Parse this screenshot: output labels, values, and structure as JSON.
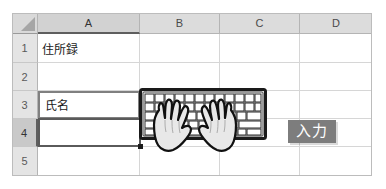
{
  "app": {
    "type": "spreadsheet",
    "accent_header_bg": "#dcdcdc",
    "selection_border": "#5a5a5a",
    "badge_bg": "#7d7d7d"
  },
  "grid": {
    "select_all_label": "",
    "columns": [
      {
        "label": "A",
        "active": true,
        "x": 26,
        "width": 102
      },
      {
        "label": "B",
        "active": false,
        "x": 128,
        "width": 80
      },
      {
        "label": "C",
        "active": false,
        "x": 208,
        "width": 80
      },
      {
        "label": "D",
        "active": false,
        "x": 288,
        "width": 72
      }
    ],
    "rows": [
      {
        "label": "1",
        "active": false,
        "y": 21,
        "height": 29
      },
      {
        "label": "2",
        "active": false,
        "y": 50,
        "height": 28
      },
      {
        "label": "3",
        "active": false,
        "y": 78,
        "height": 28
      },
      {
        "label": "4",
        "active": true,
        "y": 106,
        "height": 28
      },
      {
        "label": "5",
        "active": false,
        "y": 134,
        "height": 28
      }
    ],
    "cells": [
      {
        "ref": "A1",
        "value": "住所録"
      },
      {
        "ref": "A2",
        "value": ""
      },
      {
        "ref": "A3",
        "value": "氏名"
      },
      {
        "ref": "A4",
        "value": ""
      },
      {
        "ref": "A5",
        "value": ""
      }
    ]
  },
  "selection": {
    "boxed_cell_ref": "A3",
    "active_cell_ref": "A4",
    "fill_handle_visible": true
  },
  "illustration": {
    "keyboard_name": "keyboard-illustration",
    "hands_name": "typing-hands-illustration"
  },
  "callout": {
    "label": "入力"
  }
}
